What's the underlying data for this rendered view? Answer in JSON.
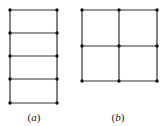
{
  "figure": {
    "line_color": "#333333",
    "node_color": "#111111",
    "panels": [
      {
        "id": "a",
        "label": "(a)",
        "label_letter": "a",
        "description": "ladder grid, 1 column x 4 rows",
        "cols_x": [
          10,
          57
        ],
        "rows_y": [
          10,
          33,
          56,
          79,
          103
        ],
        "label_pos": [
          34,
          121
        ]
      },
      {
        "id": "b",
        "label": "(b)",
        "label_letter": "b",
        "description": "square grid, 2 columns x 2 rows",
        "cols_x": [
          82,
          119,
          157
        ],
        "rows_y": [
          10,
          46,
          81
        ],
        "label_pos": [
          118,
          121
        ]
      }
    ]
  }
}
